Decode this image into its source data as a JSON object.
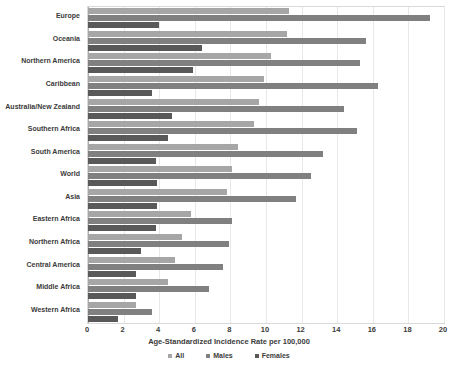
{
  "chart_data": {
    "type": "bar",
    "orientation": "horizontal",
    "title": "",
    "xlabel": "Age-Standardized Incidence Rate per 100,000",
    "ylabel": "",
    "xlim": [
      0,
      20
    ],
    "xticks": [
      0,
      2,
      4,
      6,
      8,
      10,
      12,
      14,
      16,
      18,
      20
    ],
    "grid": true,
    "legend_position": "bottom",
    "categories": [
      "Europe",
      "Oceania",
      "Northern America",
      "Caribbean",
      "Australia/New Zealand",
      "Southern Africa",
      "South America",
      "World",
      "Asia",
      "Eastern Africa",
      "Northern Africa",
      "Central America",
      "Middle Africa",
      "Western Africa"
    ],
    "series": [
      {
        "name": "All",
        "color": "#a6a6a6",
        "values": [
          11.3,
          11.2,
          10.3,
          9.9,
          9.6,
          9.3,
          8.4,
          8.1,
          7.8,
          5.8,
          5.3,
          4.9,
          4.5,
          2.7
        ]
      },
      {
        "name": "Males",
        "color": "#808080",
        "values": [
          19.2,
          15.6,
          15.3,
          16.3,
          14.4,
          15.1,
          13.2,
          12.5,
          11.7,
          8.1,
          7.9,
          7.6,
          6.8,
          3.6
        ]
      },
      {
        "name": "Females",
        "color": "#595959",
        "values": [
          4.0,
          6.4,
          5.9,
          3.6,
          4.7,
          4.5,
          3.8,
          3.9,
          3.9,
          3.8,
          3.0,
          2.7,
          2.7,
          1.7
        ]
      }
    ]
  }
}
